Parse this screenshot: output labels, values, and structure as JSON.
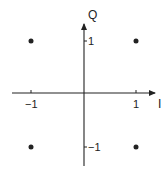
{
  "diagram": {
    "axes": {
      "x_label": "I",
      "y_label": "Q",
      "x_ticks": [
        {
          "value": -1,
          "label": "−1"
        },
        {
          "value": 1,
          "label": "1"
        }
      ],
      "y_ticks": [
        {
          "value": 1,
          "label": "1"
        },
        {
          "value": -1,
          "label": "−1"
        }
      ]
    },
    "points": [
      {
        "i": -1,
        "q": 1
      },
      {
        "i": 1,
        "q": 1
      },
      {
        "i": -1,
        "q": -1
      },
      {
        "i": 1,
        "q": -1
      }
    ],
    "colors": {
      "ink": "#222222",
      "background": "#ffffff"
    }
  }
}
